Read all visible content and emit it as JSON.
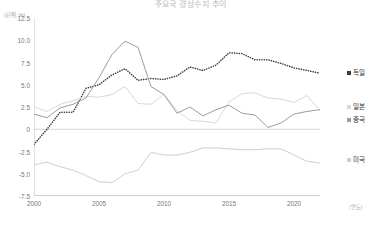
{
  "chart_data": {
    "type": "line",
    "title": "주요국 경상수지 추이",
    "unit_y": "(단위: %)",
    "unit_x": "(연도)",
    "xlabel": "",
    "ylabel": "",
    "ylim": [
      -7.5,
      12.5
    ],
    "xlim": [
      2000,
      2022
    ],
    "yticks": [
      "12.5",
      "10.0",
      "7.5",
      "5.0",
      "2.5",
      "0",
      "-2.5",
      "-5.0",
      "-7.5"
    ],
    "ytick_values": [
      12.5,
      10.0,
      7.5,
      5.0,
      2.5,
      0,
      -2.5,
      -5.0,
      -7.5
    ],
    "xticks": [
      "2000",
      "2005",
      "2010",
      "2015",
      "2020"
    ],
    "xtick_values": [
      2000,
      2005,
      2010,
      2015,
      2020
    ],
    "grid": false,
    "zero_line": true,
    "legend_position": "right",
    "x": [
      2000,
      2001,
      2002,
      2003,
      2004,
      2005,
      2006,
      2007,
      2008,
      2009,
      2010,
      2011,
      2012,
      2013,
      2014,
      2015,
      2016,
      2017,
      2018,
      2019,
      2020,
      2021,
      2022
    ],
    "series": [
      {
        "name": "독일",
        "color": "#3b3b3b",
        "style": "dotted",
        "values": [
          -1.7,
          0.0,
          1.9,
          1.9,
          4.6,
          5.0,
          6.1,
          6.8,
          5.5,
          5.7,
          5.6,
          6.0,
          7.0,
          6.6,
          7.2,
          8.6,
          8.5,
          7.8,
          7.8,
          7.4,
          6.9,
          6.6,
          6.3
        ]
      },
      {
        "name": "일본",
        "color": "#d9d9d9",
        "style": "solid",
        "values": [
          2.5,
          2.0,
          2.8,
          3.2,
          3.7,
          3.6,
          3.9,
          4.8,
          2.9,
          2.8,
          3.9,
          2.1,
          1.0,
          0.9,
          0.7,
          3.1,
          4.0,
          4.1,
          3.5,
          3.4,
          3.0,
          3.8,
          2.1
        ]
      },
      {
        "name": "중국",
        "color": "#9c9c9c",
        "style": "solid",
        "values": [
          1.7,
          1.3,
          2.4,
          2.8,
          3.5,
          5.8,
          8.4,
          9.9,
          9.2,
          4.8,
          3.9,
          1.8,
          2.5,
          1.5,
          2.2,
          2.7,
          1.8,
          1.6,
          0.2,
          0.7,
          1.7,
          2.0,
          2.2
        ]
      },
      {
        "name": "미국",
        "color": "#cfcfcf",
        "style": "solid",
        "values": [
          -4.0,
          -3.7,
          -4.2,
          -4.6,
          -5.2,
          -5.9,
          -6.0,
          -5.0,
          -4.6,
          -2.6,
          -2.9,
          -2.9,
          -2.6,
          -2.1,
          -2.1,
          -2.2,
          -2.3,
          -2.3,
          -2.2,
          -2.2,
          -2.9,
          -3.6,
          -3.8
        ]
      }
    ]
  },
  "legend": {
    "items": [
      {
        "label": "독일",
        "color": "#3b3b3b"
      },
      {
        "label": "일본",
        "color": "#d9d9d9"
      },
      {
        "label": "중국",
        "color": "#9c9c9c"
      },
      {
        "label": "미국",
        "color": "#cfcfcf"
      }
    ]
  }
}
